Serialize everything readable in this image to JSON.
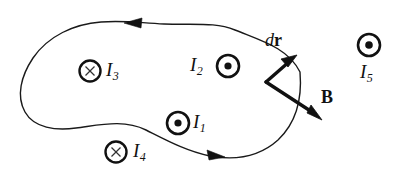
{
  "figure": {
    "background_color": "#ffffff",
    "stroke_color": "#1a1a1a",
    "loop": {
      "name": "amperian-loop",
      "direction": "counterclockwise",
      "arrow_count": 2
    },
    "currents": [
      {
        "id": "I1",
        "label": "I",
        "subscript": "1",
        "symbol": "dot-in-circle",
        "direction": "out-of-page",
        "inside_loop": true,
        "circle": {
          "cx": 178,
          "cy": 123,
          "r": 11
        },
        "label_pos": {
          "x": 193,
          "y": 114
        }
      },
      {
        "id": "I2",
        "label": "I",
        "subscript": "2",
        "symbol": "dot-in-circle",
        "direction": "out-of-page",
        "inside_loop": true,
        "circle": {
          "cx": 228,
          "cy": 66,
          "r": 11
        },
        "label_pos": {
          "x": 192,
          "y": 57
        }
      },
      {
        "id": "I3",
        "label": "I",
        "subscript": "3",
        "symbol": "cross-in-circle",
        "direction": "into-page",
        "inside_loop": true,
        "circle": {
          "cx": 90,
          "cy": 71,
          "r": 10.5
        },
        "label_pos": {
          "x": 106,
          "y": 62
        }
      },
      {
        "id": "I4",
        "label": "I",
        "subscript": "4",
        "symbol": "cross-in-circle",
        "direction": "into-page",
        "inside_loop": false,
        "circle": {
          "cx": 116,
          "cy": 152,
          "r": 10.5
        },
        "label_pos": {
          "x": 132,
          "y": 143
        }
      },
      {
        "id": "I5",
        "label": "I",
        "subscript": "5",
        "symbol": "dot-in-circle",
        "direction": "out-of-page",
        "inside_loop": false,
        "circle": {
          "cx": 369,
          "cy": 45,
          "r": 11
        },
        "label_pos": {
          "x": 358,
          "y": 70
        }
      }
    ],
    "vectors": [
      {
        "id": "dr",
        "name": "dr-vector",
        "label_d": "d",
        "label_r": "r",
        "tail": {
          "x": 266,
          "y": 82
        },
        "head": {
          "x": 296,
          "y": 56
        },
        "label_pos": {
          "x": 264,
          "y": 33
        }
      },
      {
        "id": "B",
        "name": "b-field-vector",
        "label": "B",
        "tail": {
          "x": 266,
          "y": 82
        },
        "head": {
          "x": 322,
          "y": 120
        },
        "label_pos": {
          "x": 322,
          "y": 90
        }
      }
    ]
  }
}
